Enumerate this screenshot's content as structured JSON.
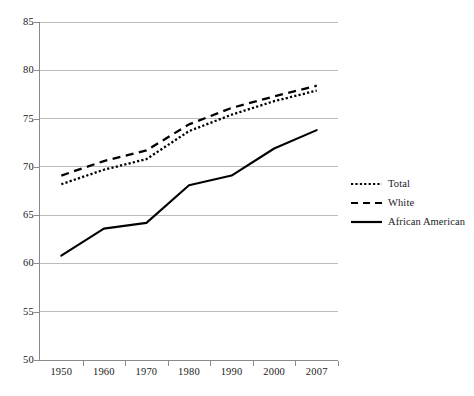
{
  "chart_data": {
    "type": "line",
    "title": "",
    "subtitle": "",
    "xlabel": "",
    "ylabel": "",
    "categories": [
      "1950",
      "1960",
      "1970",
      "1980",
      "1990",
      "2000",
      "2007"
    ],
    "x": [
      1950,
      1960,
      1970,
      1980,
      1990,
      2000,
      2007
    ],
    "ylim": [
      50,
      85
    ],
    "yticks": [
      50,
      55,
      60,
      65,
      70,
      75,
      80,
      85
    ],
    "ytick_labels": [
      "50",
      "55",
      "60",
      "65",
      "70",
      "75",
      "80",
      "85"
    ],
    "grid": "horizontal",
    "legend_position": "right",
    "series": [
      {
        "name": "Total",
        "style": "dotted",
        "color": "#000000",
        "values": [
          68.2,
          69.7,
          70.8,
          73.7,
          75.4,
          76.8,
          77.9
        ]
      },
      {
        "name": "White",
        "style": "dashed",
        "color": "#000000",
        "values": [
          69.1,
          70.6,
          71.7,
          74.4,
          76.1,
          77.3,
          78.4
        ]
      },
      {
        "name": "African American",
        "style": "solid",
        "color": "#000000",
        "values": [
          60.8,
          63.6,
          64.2,
          68.1,
          69.1,
          71.9,
          73.8
        ]
      }
    ]
  },
  "legend": {
    "items": [
      {
        "label": "Total"
      },
      {
        "label": "White"
      },
      {
        "label": "African American"
      }
    ]
  },
  "axes": {
    "y_labels": [
      "85",
      "80",
      "75",
      "70",
      "65",
      "60",
      "55",
      "50"
    ],
    "x_labels": [
      "1950",
      "1960",
      "1970",
      "1980",
      "1990",
      "2000",
      "2007"
    ]
  },
  "colors": {
    "grid": "#bdbdbd",
    "axis": "#8a8a8a",
    "series": "#000000",
    "background": "#ffffff",
    "text": "#1a1a1a"
  }
}
